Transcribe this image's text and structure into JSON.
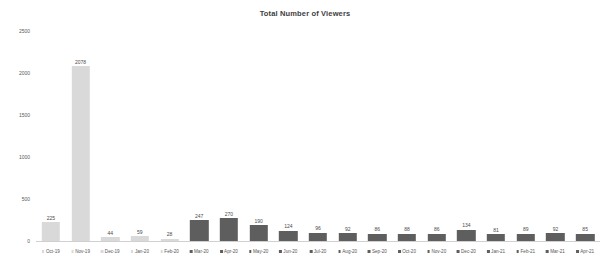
{
  "chart_data": {
    "type": "bar",
    "title": "Total Number of Viewers",
    "xlabel": "",
    "ylabel": "",
    "ylim": [
      0,
      2500
    ],
    "yticks": [
      0,
      500,
      1000,
      1500,
      2000,
      2500
    ],
    "ytick_labels": [
      "0",
      "500",
      "1000",
      "1500",
      "2000",
      "2500"
    ],
    "grid": false,
    "legend": "none",
    "categories": [
      "Oct-19",
      "Nov-19",
      "Dec-19",
      "Jan-20",
      "Feb-20",
      "Mar-20",
      "Apr-20",
      "May-20",
      "Jun-20",
      "Jul-20",
      "Aug-20",
      "Sep-20",
      "Oct-20",
      "Nov-20",
      "Dec-20",
      "Jan-21",
      "Feb-21",
      "Mar-21",
      "Apr-21"
    ],
    "values": [
      225,
      2078,
      44,
      59,
      28,
      247,
      270,
      190,
      124,
      96,
      92,
      86,
      88,
      86,
      134,
      81,
      89,
      92,
      85
    ],
    "bar_colors": [
      "#d9d9d9",
      "#d9d9d9",
      "#d9d9d9",
      "#d9d9d9",
      "#d9d9d9",
      "#5e5e5e",
      "#5e5e5e",
      "#5e5e5e",
      "#5e5e5e",
      "#5e5e5e",
      "#5e5e5e",
      "#5e5e5e",
      "#5e5e5e",
      "#5e5e5e",
      "#5e5e5e",
      "#5e5e5e",
      "#5e5e5e",
      "#5e5e5e",
      "#5e5e5e"
    ],
    "series_groups": [
      {
        "name": "light-group",
        "color": "#d9d9d9",
        "from": 0,
        "to": 4
      },
      {
        "name": "dark-group",
        "color": "#5e5e5e",
        "from": 5,
        "to": 18
      }
    ],
    "value_labels": [
      "225",
      "2078",
      "44",
      "59",
      "28",
      "247",
      "270",
      "190",
      "124",
      "96",
      "92",
      "86",
      "88",
      "86",
      "134",
      "81",
      "89",
      "92",
      "85"
    ]
  },
  "colors": {
    "background": "#ffffff",
    "title_text": "#404040",
    "axis_text": "#5a5a5a",
    "value_text": "#4a4a4a",
    "light_bar": "#d9d9d9",
    "dark_bar": "#5e5e5e",
    "axis_line": "#d0d0d0"
  }
}
